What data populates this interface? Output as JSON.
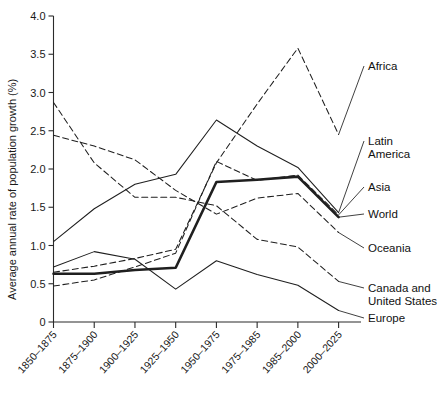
{
  "chart_data": {
    "type": "line",
    "title": "",
    "xlabel": "",
    "ylabel": "Average annual rate of population growth (%)",
    "ylim": [
      0,
      4.0
    ],
    "yticks": [
      "0",
      "0.5",
      "1.0",
      "1.5",
      "2.0",
      "2.5",
      "3.0",
      "3.5",
      "4.0"
    ],
    "ytick_values": [
      0,
      0.5,
      1.0,
      1.5,
      2.0,
      2.5,
      3.0,
      3.5,
      4.0
    ],
    "grid": false,
    "legend_position": "right-inline-labels",
    "categories": [
      "1850–1875",
      "1875–1900",
      "1900–1925",
      "1925–1950",
      "1950–1975",
      "1975–1985",
      "1985–2000",
      "2000–2025"
    ],
    "series": [
      {
        "name": "Africa",
        "style": "dashed",
        "values": [
          0.65,
          0.73,
          0.83,
          0.95,
          2.08,
          2.85,
          3.58,
          2.45
        ]
      },
      {
        "name": "Latin America",
        "style": "solid",
        "values": [
          1.05,
          1.48,
          1.8,
          1.93,
          2.64,
          2.3,
          2.02,
          1.43
        ]
      },
      {
        "name": "Asia",
        "style": "dashed",
        "values": [
          0.47,
          0.55,
          0.72,
          0.9,
          2.1,
          1.85,
          1.92,
          1.4
        ]
      },
      {
        "name": "World",
        "style": "thick",
        "values": [
          0.63,
          0.63,
          0.68,
          0.71,
          1.83,
          1.86,
          1.9,
          1.37
        ]
      },
      {
        "name": "Oceania",
        "style": "dashed",
        "values": [
          2.44,
          2.3,
          2.12,
          1.72,
          1.41,
          1.62,
          1.68,
          1.17
        ]
      },
      {
        "name": "Canada and United States",
        "style": "dashed",
        "values": [
          2.87,
          2.08,
          1.63,
          1.63,
          1.52,
          1.08,
          0.98,
          0.53
        ]
      },
      {
        "name": "Europe",
        "style": "solid",
        "values": [
          0.72,
          0.92,
          0.82,
          0.43,
          0.8,
          0.62,
          0.48,
          0.15
        ]
      }
    ],
    "series_labels": [
      {
        "text": "Africa",
        "text2": ""
      },
      {
        "text": "Latin",
        "text2": "America"
      },
      {
        "text": "Asia",
        "text2": ""
      },
      {
        "text": "World",
        "text2": ""
      },
      {
        "text": "Oceania",
        "text2": ""
      },
      {
        "text": "Canada and",
        "text2": "United States"
      },
      {
        "text": "Europe",
        "text2": ""
      }
    ]
  }
}
